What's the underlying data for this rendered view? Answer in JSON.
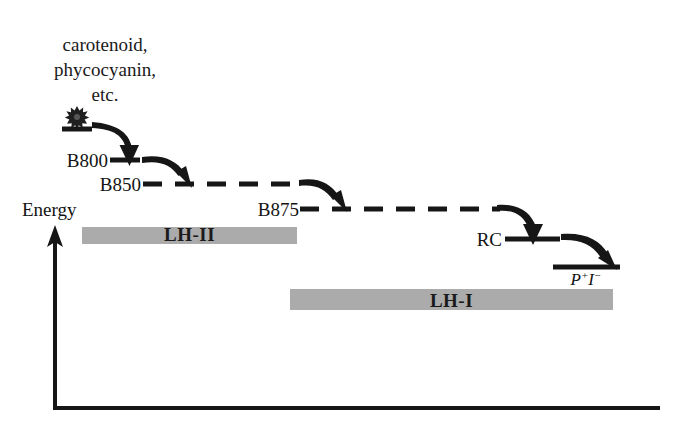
{
  "figure": {
    "background_color": "#ffffff",
    "ink_color": "#161616",
    "complex_bar_color": "#ababab"
  },
  "axes": {
    "y_label": "Energy",
    "y_axis_name": "energy-axis-arrow",
    "x_axis_name": "baseline-axis",
    "origin": [
      55,
      408
    ],
    "y_top": 228,
    "x_right": 660
  },
  "donor": {
    "lines": [
      "carotenoid,",
      "phycocyanin,",
      "etc."
    ],
    "excitation_icon": "starburst-photon-icon"
  },
  "levels": [
    {
      "id": "donor",
      "label": "",
      "label_x": 0,
      "label_y": 0,
      "line_x1": 62,
      "line_x2": 92,
      "line_y": 129,
      "style": "solid"
    },
    {
      "id": "b800",
      "label": "B800",
      "label_x": 108,
      "label_y": 166,
      "line_x1": 110,
      "line_x2": 140,
      "line_y": 160,
      "style": "solid"
    },
    {
      "id": "b850",
      "label": "B850",
      "label_x": 140,
      "label_y": 190,
      "line_x1": 143,
      "line_x2": 300,
      "line_y": 184,
      "style": "dashed"
    },
    {
      "id": "b875",
      "label": "B875",
      "label_x": 298,
      "label_y": 215,
      "line_x1": 300,
      "line_x2": 500,
      "line_y": 209,
      "style": "dashed"
    },
    {
      "id": "rc",
      "label": "RC",
      "label_x": 478,
      "label_y": 246,
      "line_x1": 505,
      "line_x2": 560,
      "line_y": 239,
      "style": "solid"
    },
    {
      "id": "product",
      "label": "",
      "label_x": 0,
      "label_y": 0,
      "line_x1": 553,
      "line_x2": 620,
      "line_y": 267,
      "style": "solid"
    }
  ],
  "product": {
    "symbol": "P",
    "charge_plus": "+",
    "acceptor": "I",
    "charge_minus": "−",
    "full_text": "P⁺I⁻",
    "x": 586,
    "y": 285
  },
  "transfer_arrows": [
    {
      "name": "arrow-donor-to-b800",
      "from": "donor",
      "to": "b800"
    },
    {
      "name": "arrow-b800-to-b850",
      "from": "b800",
      "to": "b850"
    },
    {
      "name": "arrow-b850-to-b875",
      "from": "b850",
      "to": "b875"
    },
    {
      "name": "arrow-b875-to-rc",
      "from": "b875",
      "to": "rc"
    },
    {
      "name": "arrow-rc-to-product",
      "from": "rc",
      "to": "product"
    }
  ],
  "complexes": [
    {
      "id": "lh2",
      "label": "LH-II",
      "x": 82,
      "y": 227,
      "width": 215,
      "height": 17
    },
    {
      "id": "lh1",
      "label": "LH-I",
      "x": 290,
      "y": 289,
      "width": 323,
      "height": 21
    }
  ]
}
